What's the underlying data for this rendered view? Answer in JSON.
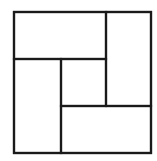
{
  "diagram": {
    "type": "rectangle-partition",
    "stroke_color": "#1a1a1a",
    "background_color": "#ffffff",
    "stroke_width": 2.2,
    "outer": {
      "x": 14,
      "y": 12,
      "width": 137,
      "height": 141
    },
    "regions": [
      {
        "name": "top-left",
        "x": 14,
        "y": 12,
        "width": 92,
        "height": 47
      },
      {
        "name": "right-tall",
        "x": 106,
        "y": 12,
        "width": 45,
        "height": 94
      },
      {
        "name": "left-tall",
        "x": 14,
        "y": 59,
        "width": 47,
        "height": 94
      },
      {
        "name": "center-square",
        "x": 61,
        "y": 59,
        "width": 45,
        "height": 47
      },
      {
        "name": "bottom-right",
        "x": 61,
        "y": 106,
        "width": 90,
        "height": 47
      }
    ]
  }
}
